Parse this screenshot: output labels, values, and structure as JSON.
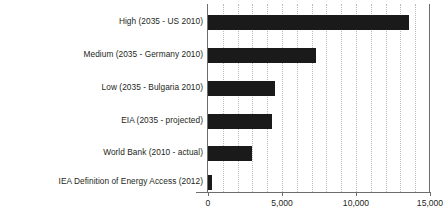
{
  "chart_data": {
    "type": "bar",
    "orientation": "horizontal",
    "title": "",
    "xlabel": "",
    "ylabel": "",
    "xlim": [
      0,
      15000
    ],
    "xticks": [
      0,
      5000,
      10000,
      15000
    ],
    "xtick_labels": [
      "0",
      "5,000",
      "10,000",
      "15,000"
    ],
    "grid": true,
    "grid_axis": "x",
    "grid_interval": 1000,
    "legend": false,
    "bar_color": "#1a1a1a",
    "categories": [
      "High (2035 - US 2010)",
      "Medium (2035 - Germany 2010)",
      "Low (2035 - Bulgaria 2010)",
      "EIA (2035 - projected)",
      "World Bank (2010 - actual)",
      "IEA Definition of Energy Access (2012)"
    ],
    "values": [
      13600,
      7300,
      4500,
      4350,
      2950,
      275
    ],
    "bars": [
      {
        "label": "High (2035 - US 2010)",
        "value": 13600
      },
      {
        "label": "Medium (2035 - Germany 2010)",
        "value": 7300
      },
      {
        "label": "Low (2035 - Bulgaria 2010)",
        "value": 4500
      },
      {
        "label": "EIA (2035 - projected)",
        "value": 4350
      },
      {
        "label": "World Bank (2010 - actual)",
        "value": 2950
      },
      {
        "label": "IEA Definition of Energy Access (2012)",
        "value": 275
      }
    ]
  }
}
